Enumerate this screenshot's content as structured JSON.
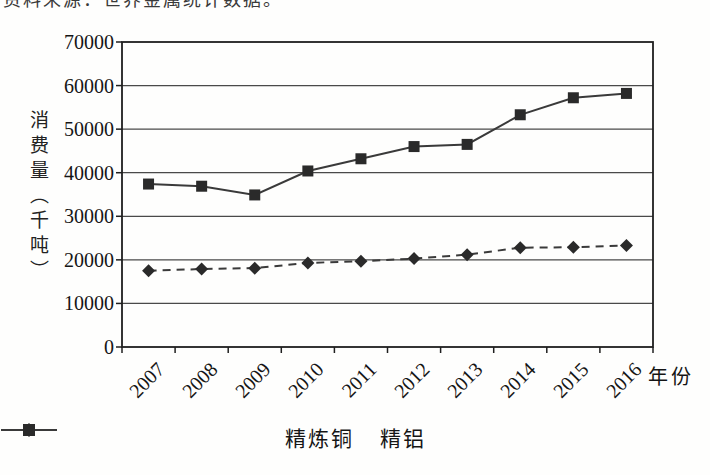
{
  "page": {
    "cropped_top_text": "资料来源：世界金属统计数据。"
  },
  "chart_data": {
    "type": "line",
    "categories": [
      "2007",
      "2008",
      "2009",
      "2010",
      "2011",
      "2012",
      "2013",
      "2014",
      "2015",
      "2016"
    ],
    "series": [
      {
        "name": "精炼铜",
        "marker": "diamond",
        "line_style": "dashed",
        "values": [
          17500,
          17900,
          18100,
          19300,
          19700,
          20300,
          21200,
          22800,
          22900,
          23300
        ]
      },
      {
        "name": "精铝",
        "marker": "square",
        "line_style": "solid",
        "values": [
          37400,
          36900,
          34900,
          40400,
          43200,
          46000,
          46500,
          53300,
          57200,
          58200
        ]
      }
    ],
    "title": "",
    "xlabel": "年份",
    "ylabel": "消费量（千吨）",
    "ylim": [
      0,
      70000
    ],
    "ytick_interval": 10000,
    "yticks": [
      "0",
      "10000",
      "20000",
      "30000",
      "40000",
      "50000",
      "60000",
      "70000"
    ],
    "grid": "horizontal",
    "legend_position": "bottom",
    "colors": {
      "line": "#3a3a3a",
      "marker": "#2a2a2a",
      "grid": "#4a4a4a",
      "border": "#1f1f1f",
      "text": "#151515",
      "background": "#fefefd"
    }
  }
}
